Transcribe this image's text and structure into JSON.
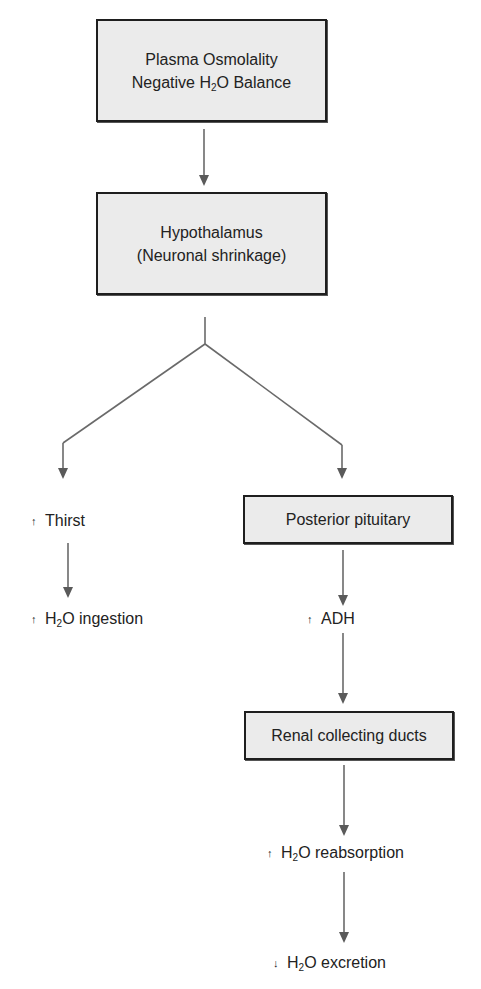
{
  "diagram": {
    "type": "flowchart",
    "colors": {
      "box_fill": "#ebebeb",
      "box_border": "#1e1e1e",
      "arrow": "#666666",
      "text": "#222222"
    },
    "nodes": {
      "plasma": {
        "line1": "Plasma Osmolality",
        "line2_pre": "Negative H",
        "line2_sub": "2",
        "line2_post": "O Balance"
      },
      "hypothalamus": {
        "line1": "Hypothalamus",
        "line2": "(Neuronal shrinkage)"
      },
      "thirst": {
        "indicator": "↑",
        "text": "Thirst"
      },
      "ingestion": {
        "indicator": "↑",
        "pre": "H",
        "sub": "2",
        "post": "O ingestion"
      },
      "posterior_pituitary": {
        "text": "Posterior pituitary"
      },
      "adh": {
        "indicator": "↑",
        "text": "ADH"
      },
      "renal": {
        "text": "Renal collecting ducts"
      },
      "reabsorption": {
        "indicator": "↑",
        "pre": "H",
        "sub": "2",
        "post": "O reabsorption"
      },
      "excretion": {
        "indicator": "↓",
        "pre": "H",
        "sub": "2",
        "post": "O excretion"
      }
    },
    "edges": [
      {
        "from": "plasma",
        "to": "hypothalamus"
      },
      {
        "from": "hypothalamus",
        "to": "thirst"
      },
      {
        "from": "hypothalamus",
        "to": "posterior_pituitary"
      },
      {
        "from": "thirst",
        "to": "ingestion"
      },
      {
        "from": "posterior_pituitary",
        "to": "adh"
      },
      {
        "from": "adh",
        "to": "renal"
      },
      {
        "from": "renal",
        "to": "reabsorption"
      },
      {
        "from": "reabsorption",
        "to": "excretion"
      }
    ]
  }
}
